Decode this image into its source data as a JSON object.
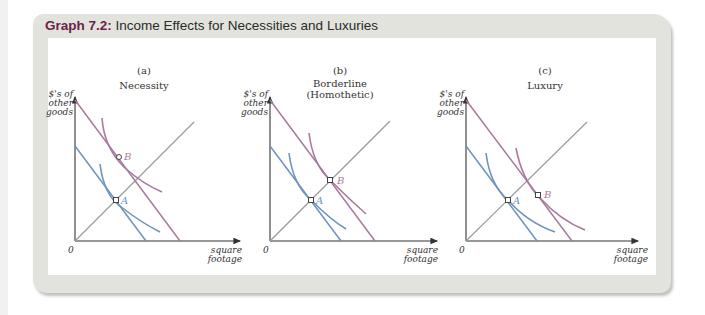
{
  "title": {
    "number": "Graph 7.2:",
    "text": " Income Effects for Necessities and Luxuries"
  },
  "colors": {
    "title_number": "#6b1f4a",
    "frame_bg": "#e2e3dc",
    "blue": "#6f93bd",
    "purple": "#a77a9c",
    "gray_line": "#9a9a9a",
    "axis": "#333333"
  },
  "axes": {
    "y_label": [
      "$'s of",
      "other",
      "goods"
    ],
    "x_label": [
      "square",
      "footage"
    ],
    "origin": "0"
  },
  "panels": [
    {
      "letter": "(a)",
      "name": "Necessity",
      "name2": "",
      "point_a": "A",
      "point_b": "B"
    },
    {
      "letter": "(b)",
      "name": "Borderline",
      "name2": "(Homothetic)",
      "point_a": "A",
      "point_b": "B"
    },
    {
      "letter": "(c)",
      "name": "Luxury",
      "name2": "",
      "point_a": "A",
      "point_b": "B"
    }
  ]
}
